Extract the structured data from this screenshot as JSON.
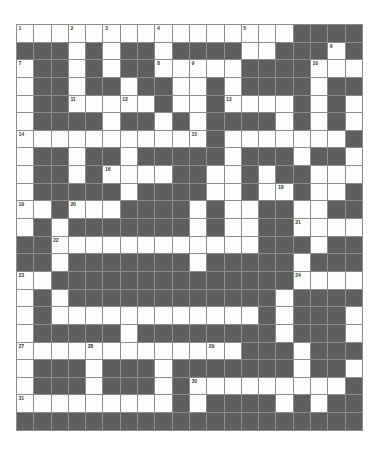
{
  "puzzle": {
    "title": "Crossword Grid",
    "type": "crossword",
    "rows": 23,
    "cols": 20,
    "cell_size_px": 17.3,
    "colors": {
      "white_cell": "#fdfdfd",
      "black_cell": "#5e5e5e",
      "grid_line": "#8d8d8d",
      "number_text": "#3a3a3a",
      "page_background": "#ffffff"
    },
    "clue_numbers": [
      1,
      2,
      3,
      4,
      5,
      6,
      7,
      8,
      9,
      10,
      11,
      12,
      13,
      14,
      15,
      16,
      17,
      18,
      19,
      20,
      21,
      22,
      23,
      24,
      25,
      26,
      27,
      28,
      29,
      30,
      31
    ],
    "grid": [
      "wwwwwwwwwwwwwwwwbbbb",
      "bbbwbwbbwbbbbwwbbbwb",
      "wbbwbwbbwwwwwbbbbwww",
      "wbbwbbwbbwwbwbbbbwbb",
      "wbbwwwwwbwwbwwwwbwbw",
      "wbbbbwbbwbwbbbbwbwbw",
      "wwwwwwwwwwwbwwwwwwwb",
      "wbbwbbwbbbbbwbbbwbbw",
      "wbbwbwwwwbbwwbwbbwww",
      "wbbbbbwbbbbwwbwwbwwb",
      "wwbwwwbbbbwbwwbbwwbb",
      "wbwbbbbbbbwbwwbbwwww",
      "bbwwwwwwwwwwwwbbbwbb",
      "bbwbbbbbbbwbbbbbwbbb",
      "wwbbbbbbbbbbbbbbwwww",
      "wbwbbbbbbbbbbbbwbbbb",
      "wbwwwwwwwwwwwwbwbbbw",
      "wbbbbbwbbbbbbbbwbbbw",
      "wwwwwwwwwwwwwbbbwbbb",
      "wbbbwbbbwbbbbbbbwbbw",
      "wbbbwbbbwbwwwwwwwwwb",
      "wwwwwwwwwbwbbbbwbwbb",
      "bbbbbbbbbbbbbbbbbbbb"
    ],
    "numbered_cells": [
      {
        "n": 1,
        "row": 0,
        "col": 0
      },
      {
        "n": 2,
        "row": 0,
        "col": 3
      },
      {
        "n": 3,
        "row": 0,
        "col": 5
      },
      {
        "n": 4,
        "row": 0,
        "col": 8
      },
      {
        "n": 5,
        "row": 0,
        "col": 13
      },
      {
        "n": 6,
        "row": 1,
        "col": 18
      },
      {
        "n": 7,
        "row": 2,
        "col": 0
      },
      {
        "n": 8,
        "row": 2,
        "col": 8
      },
      {
        "n": 9,
        "row": 2,
        "col": 10
      },
      {
        "n": 10,
        "row": 2,
        "col": 17
      },
      {
        "n": 11,
        "row": 4,
        "col": 3
      },
      {
        "n": 12,
        "row": 4,
        "col": 6
      },
      {
        "n": 13,
        "row": 4,
        "col": 12
      },
      {
        "n": 14,
        "row": 6,
        "col": 0
      },
      {
        "n": 15,
        "row": 6,
        "col": 10
      },
      {
        "n": 16,
        "row": 8,
        "col": 5
      },
      {
        "n": 17,
        "row": 8,
        "col": 10
      },
      {
        "n": 18,
        "row": 9,
        "col": 15
      },
      {
        "n": 19,
        "row": 10,
        "col": 0
      },
      {
        "n": 20,
        "row": 10,
        "col": 3
      },
      {
        "n": 21,
        "row": 11,
        "col": 16
      },
      {
        "n": 22,
        "row": 12,
        "col": 2
      },
      {
        "n": 23,
        "row": 14,
        "col": 0
      },
      {
        "n": 24,
        "row": 14,
        "col": 16
      },
      {
        "n": 25,
        "row": 15,
        "col": 3
      },
      {
        "n": 26,
        "row": 15,
        "col": 7
      },
      {
        "n": 27,
        "row": 18,
        "col": 0
      },
      {
        "n": 28,
        "row": 18,
        "col": 4
      },
      {
        "n": 29,
        "row": 18,
        "col": 11
      },
      {
        "n": 30,
        "row": 20,
        "col": 10
      },
      {
        "n": 31,
        "row": 21,
        "col": 0
      }
    ]
  }
}
